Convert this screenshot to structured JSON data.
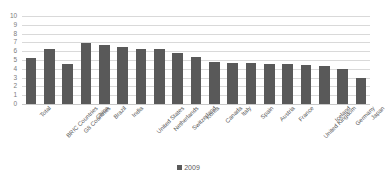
{
  "chart_data": {
    "type": "bar",
    "title": "",
    "xlabel": "",
    "ylabel": "",
    "ylim": [
      0,
      10
    ],
    "ytick_values": [
      0,
      1,
      2,
      3,
      4,
      5,
      6,
      7,
      8,
      9,
      10
    ],
    "ytick_labels": [
      "0",
      "1",
      "2",
      "3",
      "4",
      "5",
      "6",
      "7",
      "8",
      "9",
      "10"
    ],
    "grid": true,
    "legend_position": "bottom",
    "bar_color": "#595959",
    "gridline_color": "#D9D9D9",
    "tick_label_color": "#7B7B7B",
    "categories": [
      "Total",
      "BRIC Countries",
      "G8 Countries",
      "China",
      "Brazil",
      "India",
      "United States",
      "Netherlands",
      "Switzerland",
      "Korea",
      "Canada",
      "Italy",
      "Spain",
      "Austria",
      "France",
      "United Kingdom",
      "Iceland",
      "Germany",
      "Japan"
    ],
    "series": [
      {
        "name": "2009",
        "values": [
          5.2,
          6.25,
          4.6,
          6.95,
          6.65,
          6.5,
          6.2,
          6.2,
          5.85,
          5.35,
          4.8,
          4.65,
          4.65,
          4.55,
          4.55,
          4.45,
          4.3,
          3.95,
          2.9
        ]
      }
    ]
  },
  "legend": {
    "entries": [
      {
        "label": "2009",
        "color": "#595959"
      }
    ]
  }
}
